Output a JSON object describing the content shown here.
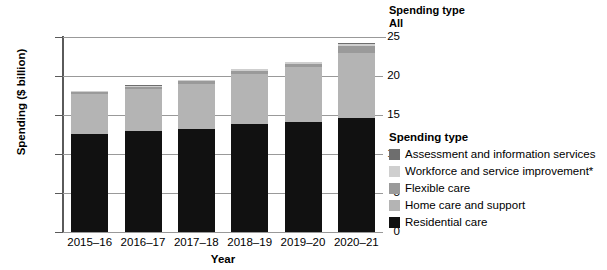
{
  "filter": {
    "title": "Spending type",
    "value": "All"
  },
  "legend": {
    "title": "Spending type",
    "items": [
      {
        "label": "Assessment and information services",
        "color": "#6e6e6e"
      },
      {
        "label": "Workforce and service improvement*",
        "color": "#cfcfcf"
      },
      {
        "label": "Flexible care",
        "color": "#9a9a9a"
      },
      {
        "label": "Home care and support",
        "color": "#b4b4b4"
      },
      {
        "label": "Residential care",
        "color": "#111111"
      }
    ]
  },
  "chart_data": {
    "type": "bar",
    "subtype": "stacked",
    "title": "",
    "xlabel": "Year",
    "ylabel": "Spending ($ billion)",
    "ylim": [
      0,
      25
    ],
    "yticks": [
      0,
      5,
      10,
      15,
      20,
      25
    ],
    "grid": true,
    "legend_position": "right",
    "categories": [
      "2015–16",
      "2016–17",
      "2017–18",
      "2018–19",
      "2019–20",
      "2020–21"
    ],
    "series": [
      {
        "name": "Residential care",
        "color": "#111111",
        "values": [
          12.6,
          12.9,
          13.2,
          13.8,
          14.1,
          14.6
        ]
      },
      {
        "name": "Home care and support",
        "color": "#b4b4b4",
        "values": [
          5.1,
          5.4,
          5.8,
          6.5,
          7.0,
          8.4
        ]
      },
      {
        "name": "Flexible care",
        "color": "#9a9a9a",
        "values": [
          0.25,
          0.3,
          0.35,
          0.4,
          0.5,
          0.9
        ]
      },
      {
        "name": "Workforce and service improvement*",
        "color": "#cfcfcf",
        "values": [
          0.1,
          0.15,
          0.1,
          0.15,
          0.15,
          0.2
        ]
      },
      {
        "name": "Assessment and information services",
        "color": "#6e6e6e",
        "values": [
          0.05,
          0.05,
          0.05,
          0.05,
          0.05,
          0.1
        ]
      }
    ],
    "totals": [
      18.1,
      18.8,
      19.5,
      20.9,
      21.8,
      24.2
    ]
  }
}
